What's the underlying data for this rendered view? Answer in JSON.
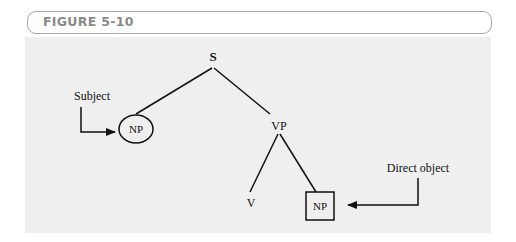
{
  "figure": {
    "title": "FIGURE 5-10"
  },
  "diagram": {
    "type": "syntax-tree",
    "nodes": {
      "root": "S",
      "subject_np": "NP",
      "vp": "VP",
      "verb": "V",
      "object_np": "NP"
    },
    "annotations": {
      "subject": "Subject",
      "direct_object": "Direct object"
    },
    "edges": [
      [
        "S",
        "NP (subject)"
      ],
      [
        "S",
        "VP"
      ],
      [
        "VP",
        "V"
      ],
      [
        "VP",
        "NP (object)"
      ]
    ],
    "colors": {
      "panel": "#efefef",
      "ink": "#111111",
      "header_text": "#8a8a8a",
      "header_border": "#a8a8a8"
    }
  }
}
